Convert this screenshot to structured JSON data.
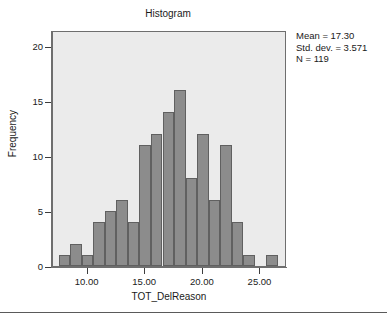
{
  "chart_data": {
    "type": "bar",
    "title": "Histogram",
    "xlabel": "TOT_DelReason",
    "ylabel": "Frequency",
    "ylim": [
      0,
      21.5
    ],
    "xlim": [
      7.0,
      27.3
    ],
    "grid": false,
    "legend": null,
    "bin_width": 1.0,
    "bin_starts": [
      7.5,
      8.5,
      9.5,
      10.5,
      11.5,
      12.5,
      13.5,
      14.5,
      15.5,
      16.5,
      17.5,
      18.5,
      19.5,
      20.5,
      21.5,
      22.5,
      23.5,
      24.5,
      25.5
    ],
    "bin_centers": [
      8.0,
      9.0,
      10.0,
      11.0,
      12.0,
      13.0,
      14.0,
      15.0,
      16.0,
      17.0,
      18.0,
      19.0,
      20.0,
      21.0,
      22.0,
      23.0,
      24.0,
      25.0,
      26.0
    ],
    "values": [
      1,
      2,
      1,
      4,
      5,
      6,
      4,
      11,
      12,
      14,
      16,
      8,
      12,
      6,
      11,
      4,
      1,
      0,
      1
    ],
    "xticks": [
      10,
      15,
      20,
      25
    ],
    "xtick_labels": [
      "10.00",
      "15.00",
      "20.00",
      "25.00"
    ],
    "yticks": [
      0,
      5,
      10,
      15,
      20
    ],
    "ytick_labels": [
      "0",
      "5",
      "10",
      "15",
      "20"
    ],
    "annotations": {
      "mean": "Mean = 17.30",
      "std_dev": "Std. dev. = 3.571",
      "n": "N = 119"
    },
    "colors": {
      "bar_fill": "#8c8c8c",
      "bar_border": "#606060",
      "plot_background": "#ebebeb",
      "axis": "#6e6e6e",
      "text": "#1a1a1a"
    }
  }
}
